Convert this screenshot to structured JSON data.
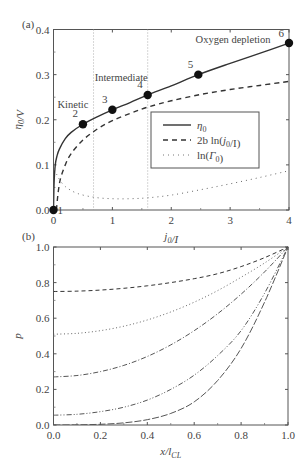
{
  "chart_data": [
    {
      "panel_label": "(a)",
      "type": "line",
      "xlabel": "j0/I",
      "ylabel": "η0/V",
      "xlim": [
        0,
        4
      ],
      "ylim": [
        0,
        0.4
      ],
      "xticks": [
        0,
        1,
        2,
        3,
        4
      ],
      "xtick_labels": [
        "0",
        "1",
        "2",
        "3",
        "4"
      ],
      "yticks": [
        0.0,
        0.1,
        0.2,
        0.3,
        0.4
      ],
      "ytick_labels": [
        "0.0",
        "0.1",
        "0.2",
        "0.3",
        "0.4"
      ],
      "grid": false,
      "vertical_lines": [
        0.68,
        1.6
      ],
      "region_labels": [
        {
          "text": "Kinetic",
          "x": 0.33,
          "y": 0.225
        },
        {
          "text": "Intermediate",
          "x": 1.15,
          "y": 0.285
        },
        {
          "text": "Oxygen depletion",
          "x": 3.05,
          "y": 0.37
        }
      ],
      "legend": {
        "position": "center-right",
        "entries": [
          "η0",
          "2b ln(j0/I)",
          "ln(Γ0)"
        ]
      },
      "series": [
        {
          "name": "η0",
          "style": "solid",
          "x": [
            0,
            0.01,
            0.03,
            0.06,
            0.1,
            0.2,
            0.3,
            0.5,
            0.75,
            1.0,
            1.3,
            1.6,
            2.0,
            2.46,
            3.0,
            3.5,
            4.0
          ],
          "y": [
            0,
            0.06,
            0.1,
            0.12,
            0.135,
            0.158,
            0.172,
            0.19,
            0.207,
            0.222,
            0.238,
            0.255,
            0.275,
            0.3,
            0.325,
            0.347,
            0.37
          ]
        },
        {
          "name": "2b ln(j0/I)",
          "style": "dashed",
          "x": [
            0.05,
            0.08,
            0.12,
            0.2,
            0.3,
            0.5,
            0.75,
            1.0,
            1.3,
            1.6,
            2.0,
            2.5,
            3.0,
            3.5,
            4.0
          ],
          "y": [
            0.0,
            0.04,
            0.07,
            0.1,
            0.125,
            0.155,
            0.18,
            0.198,
            0.214,
            0.228,
            0.242,
            0.256,
            0.267,
            0.276,
            0.285
          ]
        },
        {
          "name": "ln(Γ0)",
          "style": "dotted",
          "x": [
            0.02,
            0.05,
            0.1,
            0.2,
            0.4,
            0.7,
            1.0,
            1.3,
            1.6,
            2.0,
            2.5,
            3.0,
            3.5,
            4.0
          ],
          "y": [
            0.09,
            0.08,
            0.068,
            0.052,
            0.037,
            0.028,
            0.025,
            0.025,
            0.027,
            0.033,
            0.045,
            0.058,
            0.072,
            0.087
          ]
        }
      ],
      "markers": [
        {
          "label": "1",
          "x": 0.0,
          "y": 0.0
        },
        {
          "label": "2",
          "x": 0.5,
          "y": 0.19
        },
        {
          "label": "3",
          "x": 1.0,
          "y": 0.222
        },
        {
          "label": "4",
          "x": 1.6,
          "y": 0.255
        },
        {
          "label": "5",
          "x": 2.46,
          "y": 0.3
        },
        {
          "label": "6",
          "x": 4.0,
          "y": 0.37
        }
      ]
    },
    {
      "panel_label": "(b)",
      "type": "line",
      "xlabel": "x/lCL",
      "ylabel": "p",
      "xlim": [
        0,
        1
      ],
      "ylim": [
        0,
        1
      ],
      "xticks": [
        0,
        0.2,
        0.4,
        0.6,
        0.8,
        1.0
      ],
      "xtick_labels": [
        "0.0",
        "0.2",
        "0.4",
        "0.6",
        "0.8",
        "1.0"
      ],
      "yticks": [
        0,
        0.2,
        0.4,
        0.6,
        0.8,
        1.0
      ],
      "ytick_labels": [
        "0.0",
        "0.2",
        "0.4",
        "0.6",
        "0.8",
        "1.0"
      ],
      "grid": false,
      "series": [
        {
          "name": "curve 1",
          "style": "dashed",
          "x": [
            0,
            0.1,
            0.2,
            0.3,
            0.4,
            0.5,
            0.6,
            0.7,
            0.8,
            0.9,
            1.0
          ],
          "y": [
            0.75,
            0.752,
            0.758,
            0.768,
            0.782,
            0.8,
            0.822,
            0.85,
            0.89,
            0.94,
            1.0
          ]
        },
        {
          "name": "curve 2",
          "style": "dotted",
          "x": [
            0,
            0.1,
            0.2,
            0.3,
            0.4,
            0.5,
            0.6,
            0.7,
            0.8,
            0.9,
            1.0
          ],
          "y": [
            0.51,
            0.515,
            0.53,
            0.555,
            0.59,
            0.635,
            0.69,
            0.755,
            0.83,
            0.91,
            1.0
          ]
        },
        {
          "name": "curve 3",
          "style": "dashdot",
          "x": [
            0,
            0.1,
            0.2,
            0.3,
            0.4,
            0.5,
            0.6,
            0.7,
            0.8,
            0.9,
            1.0
          ],
          "y": [
            0.27,
            0.278,
            0.3,
            0.335,
            0.385,
            0.45,
            0.53,
            0.625,
            0.735,
            0.86,
            1.0
          ]
        },
        {
          "name": "curve 4",
          "style": "dashdotdot",
          "x": [
            0,
            0.1,
            0.2,
            0.3,
            0.4,
            0.5,
            0.6,
            0.7,
            0.8,
            0.9,
            1.0
          ],
          "y": [
            0.055,
            0.06,
            0.075,
            0.1,
            0.14,
            0.2,
            0.28,
            0.39,
            0.53,
            0.74,
            1.0
          ]
        },
        {
          "name": "curve 5",
          "style": "longdash",
          "x": [
            0,
            0.1,
            0.2,
            0.3,
            0.4,
            0.5,
            0.6,
            0.7,
            0.8,
            0.9,
            1.0
          ],
          "y": [
            0.0,
            0.001,
            0.004,
            0.012,
            0.03,
            0.065,
            0.13,
            0.25,
            0.43,
            0.69,
            1.0
          ]
        }
      ]
    }
  ]
}
